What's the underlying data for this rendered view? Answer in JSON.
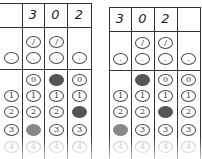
{
  "answer_grids": [
    {
      "name": "left",
      "header": [
        "",
        "3",
        "0",
        "2"
      ],
      "fraction_row": [
        "",
        "/",
        "/",
        ""
      ],
      "decimal_row": [
        ".",
        ".",
        ".",
        "."
      ],
      "digit_labels": [
        "0",
        "1",
        "2",
        "3",
        "4"
      ],
      "filled": {
        "col1": null,
        "col2": "3",
        "col3": "0",
        "col4": "2"
      }
    },
    {
      "name": "right",
      "header": [
        "3",
        "0",
        "2",
        ""
      ],
      "fraction_row": [
        "",
        "/",
        "/",
        ""
      ],
      "decimal_row": [
        ".",
        ".",
        ".",
        "."
      ],
      "digit_labels": [
        "0",
        "1",
        "2",
        "3",
        "4"
      ],
      "filled": {
        "col1": "3",
        "col2": "0",
        "col3": "2",
        "col4": null
      }
    }
  ],
  "colors": {
    "line": "#333333",
    "fill_dark": "#555555",
    "fill_light": "#888888"
  }
}
